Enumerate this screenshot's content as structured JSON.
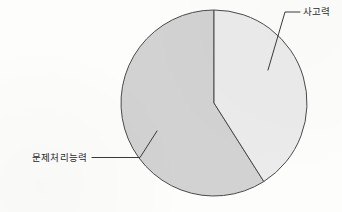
{
  "chart_data": {
    "type": "pie",
    "title": "",
    "subtitle": "",
    "xlabel": "",
    "ylabel": "",
    "legend_position": "none",
    "grid": false,
    "labels_outside": true,
    "categories": [
      "사고력",
      "문제처리능력"
    ],
    "values": [
      41,
      59
    ],
    "slices": [
      {
        "name": "사고력",
        "value": 41,
        "color": "#ebebeb",
        "start_angle_deg": 0,
        "end_angle_deg": 147.6,
        "label": "사고력"
      },
      {
        "name": "문제처리능력",
        "value": 59,
        "color": "#d2d2d2",
        "start_angle_deg": 147.6,
        "end_angle_deg": 360,
        "label": "문제처리능력"
      }
    ]
  },
  "geometry": {
    "center_x": 214,
    "center_y": 103,
    "radius": 93
  },
  "annotations": {
    "thinking": {
      "text": "사고력",
      "text_x": 303,
      "text_y": 15,
      "leader_path": "M 300 12 L 285 12 L 268 70"
    },
    "problem_solving": {
      "text": "문제처리능력",
      "text_x": 32,
      "text_y": 161,
      "leader_path": "M 92 157.5 L 140 157.5 L 157 131"
    }
  },
  "colors": {
    "background": "#fdfdfc",
    "slice_light": "#ebebeb",
    "slice_dark": "#d2d2d2",
    "outline": "#4a4a4a",
    "text": "#2b2b2b"
  }
}
